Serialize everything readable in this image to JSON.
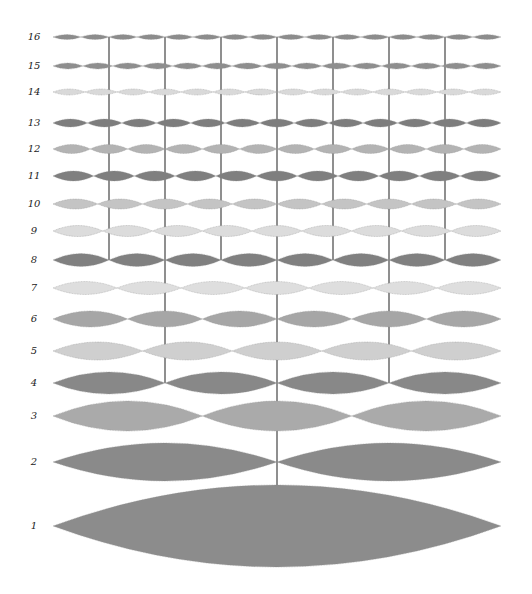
{
  "diagram": {
    "title": "",
    "left_x": 53,
    "right_x": 501,
    "node_line_color": "#333333",
    "outline_color": "#8a8a8a",
    "rows": [
      {
        "label": "16",
        "n": 16,
        "y": 37,
        "half": 2.5,
        "color": "#8c8c8c"
      },
      {
        "label": "15",
        "n": 15,
        "y": 66,
        "half": 3,
        "color": "#8e8e8e"
      },
      {
        "label": "14",
        "n": 14,
        "y": 92,
        "half": 3,
        "color": "#d9d9d9"
      },
      {
        "label": "13",
        "n": 13,
        "y": 123,
        "half": 4,
        "color": "#7d7d7d"
      },
      {
        "label": "12",
        "n": 12,
        "y": 149,
        "half": 4.5,
        "color": "#b3b3b3"
      },
      {
        "label": "11",
        "n": 11,
        "y": 176,
        "half": 5,
        "color": "#7f7f7f"
      },
      {
        "label": "10",
        "n": 10,
        "y": 204,
        "half": 5,
        "color": "#c4c4c4"
      },
      {
        "label": "9",
        "n": 9,
        "y": 231,
        "half": 5.5,
        "color": "#dcdcdc"
      },
      {
        "label": "8",
        "n": 8,
        "y": 260,
        "half": 6.5,
        "color": "#808080"
      },
      {
        "label": "7",
        "n": 7,
        "y": 288,
        "half": 6.5,
        "color": "#dedede"
      },
      {
        "label": "6",
        "n": 6,
        "y": 319,
        "half": 8,
        "color": "#a6a6a6"
      },
      {
        "label": "5",
        "n": 5,
        "y": 351,
        "half": 9,
        "color": "#cfcfcf"
      },
      {
        "label": "4",
        "n": 4,
        "y": 383,
        "half": 11,
        "color": "#888888"
      },
      {
        "label": "3",
        "n": 3,
        "y": 416,
        "half": 15,
        "color": "#aaaaaa"
      },
      {
        "label": "2",
        "n": 2,
        "y": 462,
        "half": 19,
        "color": "#8a8a8a"
      },
      {
        "label": "1",
        "n": 1,
        "y": 526,
        "half": 41,
        "color": "#8c8c8c"
      }
    ],
    "node_lines": [
      {
        "fraction": "2/16",
        "top_y": 37,
        "bottom_y": 260
      },
      {
        "fraction": "4/16",
        "top_y": 37,
        "bottom_y": 383
      },
      {
        "fraction": "6/16",
        "top_y": 37,
        "bottom_y": 260
      },
      {
        "fraction": "8/16",
        "top_y": 37,
        "bottom_y": 486
      },
      {
        "fraction": "10/16",
        "top_y": 37,
        "bottom_y": 260
      },
      {
        "fraction": "12/16",
        "top_y": 37,
        "bottom_y": 383
      },
      {
        "fraction": "14/16",
        "top_y": 37,
        "bottom_y": 260
      }
    ]
  }
}
